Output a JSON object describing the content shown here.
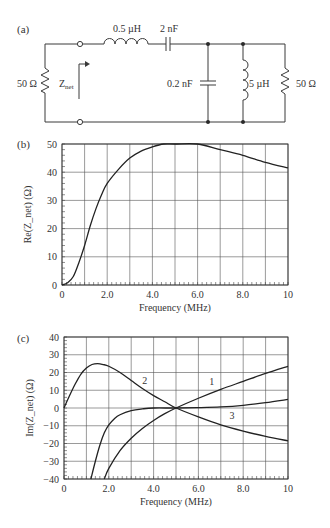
{
  "panels": {
    "a": {
      "label": "(a)",
      "components": {
        "source_resistor": "50 Ω",
        "series_inductor": "0.5 µH",
        "series_capacitor": "2 nF",
        "shunt_capacitor": "0.2 nF",
        "shunt_inductor": "5 µH",
        "load_resistor": "50 Ω",
        "znet_main": "Z",
        "znet_sub": "net"
      }
    },
    "b": {
      "label": "(b)"
    },
    "c": {
      "label": "(c)"
    }
  },
  "chart_data": [
    {
      "type": "line",
      "panel": "(b)",
      "title": "",
      "xlabel": "Frequency (MHz)",
      "ylabel": "Re(Z_net) (Ω)",
      "xlim": [
        0,
        10
      ],
      "ylim": [
        0,
        50
      ],
      "grid": true,
      "x_ticks": [
        "0",
        "2.0",
        "4.0",
        "6.0",
        "8.0",
        "10"
      ],
      "y_ticks": [
        "0",
        "10",
        "20",
        "30",
        "40",
        "50"
      ],
      "series": [
        {
          "name": "Re(Z_net)",
          "x": [
            0,
            0.25,
            0.5,
            0.75,
            1.0,
            1.25,
            1.5,
            1.75,
            2.0,
            2.5,
            3.0,
            3.5,
            4.0,
            4.5,
            5.0,
            6.0,
            7.0,
            8.0,
            9.0,
            10.0
          ],
          "y": [
            0,
            0.8,
            3,
            8,
            14,
            21,
            27,
            32,
            36,
            41,
            45,
            47.5,
            49,
            50,
            50,
            50,
            48,
            46,
            43.5,
            41.5
          ]
        }
      ]
    },
    {
      "type": "line",
      "panel": "(c)",
      "title": "",
      "xlabel": "Frequency (MHz)",
      "ylabel": "Im(Z_net) (Ω)",
      "xlim": [
        0,
        10
      ],
      "ylim": [
        -40,
        40
      ],
      "grid": true,
      "x_ticks": [
        "0",
        "2.0",
        "4.0",
        "6.0",
        "8.0",
        "10"
      ],
      "y_ticks": [
        "40",
        "30",
        "20",
        "10",
        "0",
        "−10",
        "−20",
        "−30",
        "−40"
      ],
      "annotations": [
        {
          "text": "1",
          "x": 6.6,
          "y": 15
        },
        {
          "text": "2",
          "x": 3.6,
          "y": 16
        },
        {
          "text": "3",
          "x": 7.5,
          "y": -4
        }
      ],
      "series": [
        {
          "name": "1",
          "x": [
            1.8,
            2.0,
            2.5,
            3.0,
            3.5,
            4.0,
            4.5,
            5.0,
            6.0,
            7.0,
            8.0,
            9.0,
            10.0
          ],
          "y": [
            -40,
            -34,
            -24,
            -17,
            -11.5,
            -7,
            -3.2,
            0,
            5.5,
            10.5,
            15,
            19.5,
            23.5
          ]
        },
        {
          "name": "2",
          "x": [
            0,
            0.25,
            0.5,
            0.75,
            1.0,
            1.25,
            1.5,
            1.75,
            2.0,
            2.5,
            3.0,
            3.5,
            4.0,
            4.5,
            5.0,
            6.0,
            7.0,
            8.0,
            9.0,
            10.0
          ],
          "y": [
            0,
            7,
            13.5,
            19,
            22.5,
            24.5,
            25,
            24.5,
            23.5,
            20,
            15.5,
            11,
            7,
            3.5,
            0,
            -5,
            -9.5,
            -13,
            -16,
            -18.5
          ]
        },
        {
          "name": "3",
          "x": [
            1.2,
            1.4,
            1.6,
            1.8,
            2.0,
            2.25,
            2.5,
            3.0,
            3.5,
            4.0,
            5.0,
            6.0,
            7.0,
            8.0,
            9.0,
            10.0
          ],
          "y": [
            -40,
            -30,
            -21,
            -14,
            -9.5,
            -6,
            -3.8,
            -1.5,
            -0.5,
            0,
            0,
            0.2,
            0.6,
            1.5,
            3,
            4.8
          ]
        }
      ]
    }
  ]
}
